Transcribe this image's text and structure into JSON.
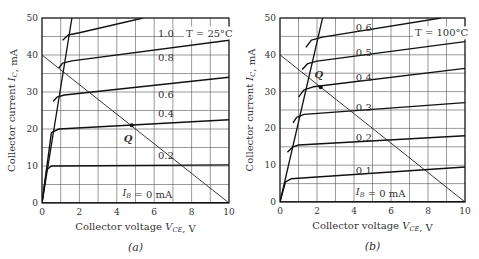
{
  "chart_data": [
    {
      "type": "line",
      "panel": "a",
      "caption": "(a)",
      "title": "",
      "annotation": "T = 25°C",
      "xlabel": "Collector voltage V_CE, V",
      "ylabel": "Collector current I_C, mA",
      "xlim": [
        0,
        10
      ],
      "ylim": [
        0,
        50
      ],
      "xticks": [
        0,
        2,
        4,
        6,
        8,
        10
      ],
      "yticks": [
        0,
        10,
        20,
        30,
        40,
        50
      ],
      "grid": {
        "x_step": 1,
        "y_step": 5
      },
      "series": [
        {
          "name": "I_B = 0 mA",
          "label": "I_B = 0 mA",
          "points": [
            [
              0,
              0
            ],
            [
              10,
              0.1
            ]
          ]
        },
        {
          "name": "0.2",
          "label": "0.2",
          "points": [
            [
              0,
              0
            ],
            [
              0.25,
              9
            ],
            [
              0.5,
              10
            ],
            [
              10,
              10.3
            ]
          ]
        },
        {
          "name": "0.4",
          "label": "0.4",
          "points": [
            [
              0,
              0
            ],
            [
              0.5,
              19
            ],
            [
              0.9,
              20
            ],
            [
              10,
              22.5
            ]
          ]
        },
        {
          "name": "0.6",
          "label": "0.6",
          "points": [
            [
              0.6,
              27.5
            ],
            [
              0.8,
              28.6
            ],
            [
              1.2,
              29.2
            ],
            [
              10,
              34
            ]
          ]
        },
        {
          "name": "0.8",
          "label": "0.8",
          "points": [
            [
              0.9,
              36.5
            ],
            [
              1.1,
              37.8
            ],
            [
              1.6,
              38.4
            ],
            [
              10,
              44
            ]
          ]
        },
        {
          "name": "1.0",
          "label": "1.0",
          "points": [
            [
              1.1,
              44
            ],
            [
              1.4,
              45.4
            ],
            [
              2,
              46
            ],
            [
              5.4,
              50
            ]
          ]
        }
      ],
      "saturation_line": [
        [
          0,
          0
        ],
        [
          1.6,
          50
        ]
      ],
      "load_line": {
        "points": [
          [
            0,
            40
          ],
          [
            10,
            0
          ]
        ],
        "Vcc": 10,
        "Ic_max": 40
      },
      "q_point": {
        "label": "Q",
        "V": 4.8,
        "I": 21
      }
    },
    {
      "type": "line",
      "panel": "b",
      "caption": "(b)",
      "title": "",
      "annotation": "T = 100°C",
      "xlabel": "Collector voltage V_CE, V",
      "ylabel": "Collector current I_C, mA",
      "xlim": [
        0,
        10
      ],
      "ylim": [
        0,
        50
      ],
      "xticks": [
        0,
        2,
        4,
        6,
        8,
        10
      ],
      "yticks": [
        0,
        10,
        20,
        30,
        40,
        50
      ],
      "grid": {
        "x_step": 1,
        "y_step": 5
      },
      "series": [
        {
          "name": "I_B = 0 mA",
          "label": "I_B = 0 mA",
          "points": [
            [
              0,
              0
            ],
            [
              10,
              0.1
            ]
          ]
        },
        {
          "name": "0.1",
          "label": "0.1",
          "points": [
            [
              0,
              0
            ],
            [
              0.3,
              5.5
            ],
            [
              0.6,
              6.3
            ],
            [
              10,
              9.5
            ]
          ]
        },
        {
          "name": "0.2",
          "label": "0.2",
          "points": [
            [
              0.4,
              13.5
            ],
            [
              0.7,
              15
            ],
            [
              1,
              15.5
            ],
            [
              10,
              18
            ]
          ]
        },
        {
          "name": "0.3",
          "label": "0.3",
          "points": [
            [
              0.7,
              21.5
            ],
            [
              0.9,
              23
            ],
            [
              1.3,
              23.8
            ],
            [
              10,
              27
            ]
          ]
        },
        {
          "name": "0.4",
          "label": "0.4",
          "points": [
            [
              1.0,
              28.5
            ],
            [
              1.3,
              30.5
            ],
            [
              1.8,
              31.3
            ],
            [
              10,
              36.3
            ]
          ]
        },
        {
          "name": "0.5",
          "label": "0.5",
          "points": [
            [
              1.2,
              36
            ],
            [
              1.5,
              37.6
            ],
            [
              2,
              38.3
            ],
            [
              10,
              43.6
            ]
          ]
        },
        {
          "name": "0.6",
          "label": "0.6",
          "points": [
            [
              1.4,
              42
            ],
            [
              1.7,
              44
            ],
            [
              2.3,
              44.8
            ],
            [
              8.7,
              50
            ]
          ]
        }
      ],
      "saturation_line": [
        [
          0,
          0
        ],
        [
          2.3,
          50
        ]
      ],
      "load_line": {
        "points": [
          [
            0,
            40
          ],
          [
            10,
            0
          ]
        ],
        "Vcc": 10,
        "Ic_max": 40
      },
      "q_point": {
        "label": "Q",
        "V": 2.2,
        "I": 31.2
      }
    }
  ],
  "panels": [
    {
      "id": "a",
      "box": {
        "x0": 42,
        "y0": 18,
        "x1": 229,
        "y1": 203
      },
      "curve_labels": [
        {
          "text": "1.0",
          "V": 6.2,
          "I": 44.8
        },
        {
          "text": "0.8",
          "V": 6.2,
          "I": 38.3
        },
        {
          "text": "0.6",
          "V": 6.2,
          "I": 28.5
        },
        {
          "text": "0.4",
          "V": 6.2,
          "I": 23.2
        },
        {
          "text": "0.2",
          "V": 6.2,
          "I": 12
        },
        {
          "text": "I_B = 0 mA",
          "V": 4.3,
          "I": 1.8
        }
      ],
      "temp_label": {
        "V": 7.7,
        "I": 45
      },
      "q_label": {
        "V": 4.6,
        "I": 16.6
      }
    },
    {
      "id": "b",
      "box": {
        "x0": 40,
        "y0": 18,
        "x1": 225,
        "y1": 202
      },
      "curve_labels": [
        {
          "text": "0.6",
          "V": 4.1,
          "I": 46.5
        },
        {
          "text": "0.5",
          "V": 4.1,
          "I": 39.8
        },
        {
          "text": "0.4",
          "V": 4.1,
          "I": 33
        },
        {
          "text": "0.3",
          "V": 4.1,
          "I": 24.6
        },
        {
          "text": "0.2",
          "V": 4.1,
          "I": 16.5
        },
        {
          "text": "0.1",
          "V": 4.1,
          "I": 7.5
        },
        {
          "text": "I_B = 0 mA",
          "V": 4.1,
          "I": 1.8
        }
      ],
      "temp_label": {
        "V": 7.3,
        "I": 45
      },
      "q_label": {
        "V": 2.1,
        "I": 33.8
      }
    }
  ]
}
